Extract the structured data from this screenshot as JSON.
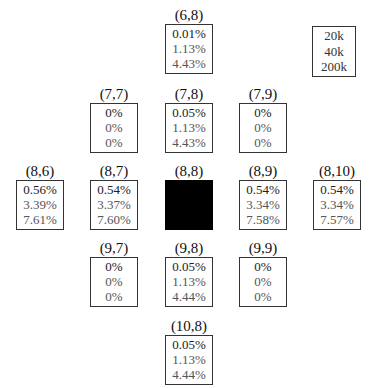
{
  "diagram": {
    "center": {
      "label": "(8,8)",
      "filled": true,
      "color": "#000000"
    },
    "legend": {
      "items": [
        "20k",
        "40k",
        "200k"
      ]
    },
    "cells": [
      {
        "id": "6-8",
        "label": "(6,8)",
        "values": [
          "0.01%",
          "1.13%",
          "4.43%"
        ]
      },
      {
        "id": "7-7",
        "label": "(7,7)",
        "values": [
          "0%",
          "0%",
          "0%"
        ]
      },
      {
        "id": "7-8",
        "label": "(7,8)",
        "values": [
          "0.05%",
          "1.13%",
          "4.43%"
        ]
      },
      {
        "id": "7-9",
        "label": "(7,9)",
        "values": [
          "0%",
          "0%",
          "0%"
        ]
      },
      {
        "id": "8-6",
        "label": "(8,6)",
        "values": [
          "0.56%",
          "3.39%",
          "7.61%"
        ]
      },
      {
        "id": "8-7",
        "label": "(8,7)",
        "values": [
          "0.54%",
          "3.37%",
          "7.60%"
        ]
      },
      {
        "id": "8-9",
        "label": "(8,9)",
        "values": [
          "0.54%",
          "3.34%",
          "7.58%"
        ]
      },
      {
        "id": "8-10",
        "label": "(8,10)",
        "values": [
          "0.54%",
          "3.34%",
          "7.57%"
        ]
      },
      {
        "id": "9-7",
        "label": "(9,7)",
        "values": [
          "0%",
          "0%",
          "0%"
        ]
      },
      {
        "id": "9-8",
        "label": "(9,8)",
        "values": [
          "0.05%",
          "1.13%",
          "4.44%"
        ]
      },
      {
        "id": "9-9",
        "label": "(9,9)",
        "values": [
          "0%",
          "0%",
          "0%"
        ]
      },
      {
        "id": "10-8",
        "label": "(10,8)",
        "values": [
          "0.05%",
          "1.13%",
          "4.44%"
        ]
      }
    ]
  }
}
